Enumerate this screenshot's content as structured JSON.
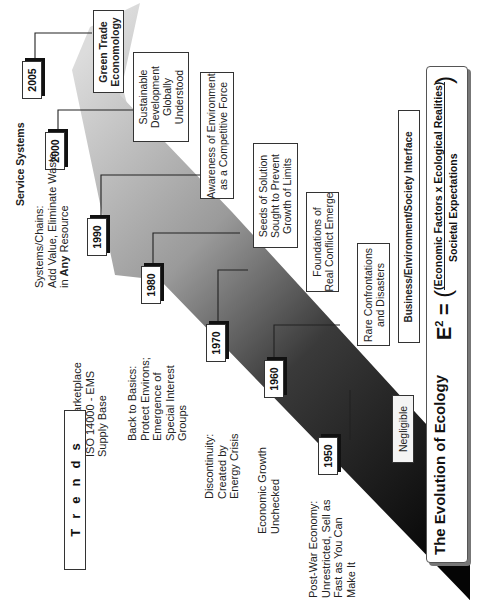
{
  "title": "The Evolution of Ecology",
  "formula": {
    "lhs": "E",
    "exponent": "2",
    "equals": "=",
    "numerator": "(Economic Factors x Ecological Realities)",
    "denominator": "Societal Expectations"
  },
  "interface_label": "Business/Environment/Society Interface",
  "service_systems_label": "Service Systems",
  "trends_label": "Trends",
  "trends_letters": [
    "T",
    "r",
    "e",
    "n",
    "d",
    "s"
  ],
  "years": [
    "2005",
    "2000",
    "1990",
    "1980",
    "1970",
    "1960",
    "1950"
  ],
  "events": [
    {
      "year": "2005",
      "text": [
        "Green Trade",
        "Economology"
      ]
    },
    {
      "year": "2000",
      "text": [
        "Sustainable",
        "Development",
        "Globally",
        "Understood"
      ]
    },
    {
      "year": "1990",
      "text": [
        "Awareness of Environment",
        "as a Competitive Force"
      ]
    },
    {
      "year": "1980",
      "text": [
        "Seeds of Solution",
        "Sought to Prevent",
        "Growth of Limits"
      ]
    },
    {
      "year": "1970",
      "text": [
        "Foundations of",
        "Real Conflict Emerge"
      ]
    },
    {
      "year": "1960",
      "text": [
        "Rare Confrontations",
        "and Disasters"
      ]
    },
    {
      "year": "1950",
      "text": [
        "Negligible"
      ]
    }
  ],
  "trends": [
    {
      "lines": [
        "Systems/Chains:",
        "Add Value, Eliminate Waste"
      ],
      "line3_prefix": "in ",
      "line3_bold": "Any",
      "line3_suffix": " Resource"
    },
    {
      "lines": [
        "Global Marketplace",
        "ISO 14000 - EMS",
        "Supply Base"
      ]
    },
    {
      "lines": [
        "Back to Basics:",
        "Protect Environs;",
        "Emergence of",
        "Special Interest",
        "Groups"
      ]
    },
    {
      "lines": [
        "Discontinuity:",
        "Created by",
        "Energy Crisis"
      ]
    },
    {
      "lines": [
        "Economic Growth",
        "Unchecked"
      ]
    },
    {
      "lines": [
        "Post-War Economy:",
        "Unrestricted, Sell as",
        "Fast as You Can",
        "Make It"
      ]
    }
  ],
  "colors": {
    "wedge_light": "#d4d4d4",
    "wedge_dark": "#0a0a0a",
    "line": "#222222",
    "panel_border": "#555555"
  }
}
